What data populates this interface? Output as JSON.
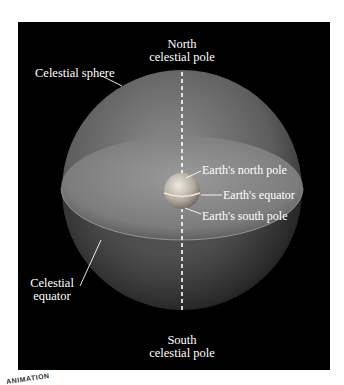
{
  "figure": {
    "labels": {
      "north_pole_line1": "North",
      "north_pole_line2": "celestial pole",
      "celestial_sphere": "Celestial sphere",
      "earth_north_pole": "Earth's north pole",
      "earth_equator": "Earth's equator",
      "earth_south_pole": "Earth's south pole",
      "celestial_equator_line1": "Celestial",
      "celestial_equator_line2": "equator",
      "south_pole_line1": "South",
      "south_pole_line2": "celestial pole"
    },
    "corner_badge": "ANIMATION"
  },
  "colors": {
    "background": "#000000",
    "sphere": "#6a6a6a",
    "plane": "#8a8a8a",
    "earth": "#c8c4bc",
    "text": "#ffffff"
  }
}
